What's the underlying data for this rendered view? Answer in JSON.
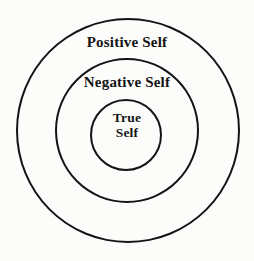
{
  "diagram": {
    "type": "concentric-circles",
    "rings": [
      {
        "id": "outer",
        "label": "Positive Self"
      },
      {
        "id": "middle",
        "label": "Negative Self"
      },
      {
        "id": "inner",
        "label_line1": "True",
        "label_line2": "Self"
      }
    ],
    "colors": {
      "stroke": "#141414",
      "text": "#141414",
      "background": "#fcfcfb"
    }
  }
}
